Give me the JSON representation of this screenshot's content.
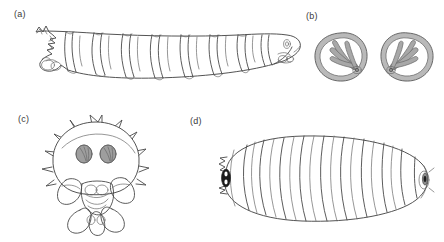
{
  "figure": {
    "background_color": "#ffffff",
    "line_color": "#4a4a4a",
    "fill_gray": "#a8a8a8",
    "dark_mark_color": "#1c1c1c",
    "width": 444,
    "height": 242
  },
  "panels": [
    {
      "id": "a",
      "label": "(a)",
      "subject": "larva-lateral-view",
      "description": "Segmented fly larva in lateral view, posterior spiracular end at left, tapered head with mouth hooks at right",
      "segment_count": 11,
      "orientation": "horizontal"
    },
    {
      "id": "b",
      "label": "(b)",
      "subject": "posterior-spiracular-plates",
      "description": "Pair of rounded spiracular plates with thick gray peritreme rim and four elongate gray spiracular slits radiating from a button",
      "plate_count": 2,
      "slits_per_plate": 4
    },
    {
      "id": "c",
      "label": "(c)",
      "subject": "larva-posterior-end-view",
      "description": "Posterior end view showing dome-shaped segment with marginal spine-like projections, a pair of gray spiracular plates, and lobed anal division below",
      "spiracle_count": 2,
      "marginal_projection_count": 12
    },
    {
      "id": "d",
      "label": "(d)",
      "subject": "puparium-dorsal-view",
      "description": "Oval barrel-shaped puparium in dorsal view with transverse segment bands and dark spiracular marks at each end",
      "segment_band_count": 10,
      "end_mark_count": 2
    }
  ]
}
